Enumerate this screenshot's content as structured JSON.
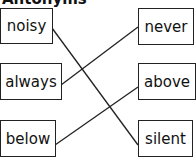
{
  "title": "Antonyms",
  "left_words": [
    "noisy",
    "always",
    "below"
  ],
  "right_words": [
    "never",
    "above",
    "silent"
  ],
  "connections": [
    {
      "from": "noisy",
      "to": "silent"
    },
    {
      "from": "always",
      "to": "never"
    },
    {
      "from": "below",
      "to": "above"
    }
  ]
}
